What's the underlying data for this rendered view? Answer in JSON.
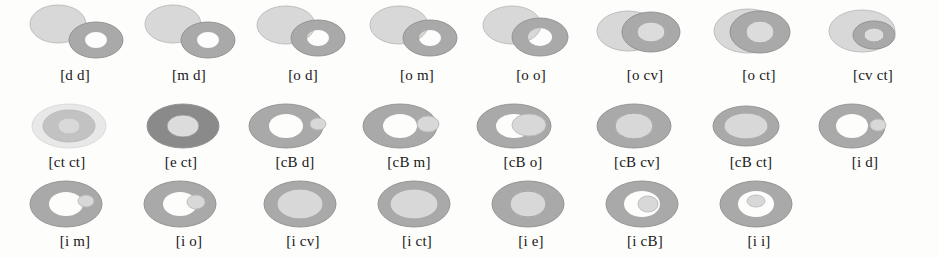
{
  "figure": {
    "background_color": "#fdfdfc",
    "label_color": "#181818",
    "palette": {
      "disc_light": "#d8d8d8",
      "disc_light_stroke": "#b9b9b9",
      "annulus_mid": "#a9a9a9",
      "annulus_mid_stroke": "#8e8e8e",
      "annulus_dark": "#8a8a8a",
      "hole_white": "#ffffff",
      "hole_light": "#dcdcdc",
      "outline": "#9a9a9a"
    },
    "rows": [
      {
        "row_index": 1,
        "cells": [
          {
            "label": "[d d]",
            "relation": "disjoint-disjoint",
            "disc": {
              "cx": 38,
              "cy": 24,
              "rx": 28,
              "ry": 19,
              "fill": "disc_light"
            },
            "annulus": {
              "cx": 76,
              "cy": 40,
              "rx": 27,
              "ry": 18,
              "hole_rx": 11,
              "hole_ry": 8,
              "fill": "annulus_mid",
              "hole_fill": "hole_white"
            }
          },
          {
            "label": "[m d]",
            "relation": "meet-disjoint",
            "disc": {
              "cx": 39,
              "cy": 24,
              "rx": 28,
              "ry": 19,
              "fill": "disc_light"
            },
            "annulus": {
              "cx": 74,
              "cy": 40,
              "rx": 27,
              "ry": 18,
              "hole_rx": 11,
              "hole_ry": 8,
              "fill": "annulus_mid",
              "hole_fill": "hole_white"
            }
          },
          {
            "label": "[o d]",
            "relation": "overlap-disjoint",
            "disc": {
              "cx": 38,
              "cy": 25,
              "rx": 29,
              "ry": 19,
              "fill": "disc_light"
            },
            "annulus": {
              "cx": 70,
              "cy": 38,
              "rx": 27,
              "ry": 18,
              "hole_rx": 11,
              "hole_ry": 8,
              "fill": "annulus_mid",
              "hole_fill": "hole_white"
            }
          },
          {
            "label": "[o m]",
            "relation": "overlap-meet",
            "disc": {
              "cx": 37,
              "cy": 25,
              "rx": 29,
              "ry": 19,
              "fill": "disc_light"
            },
            "annulus": {
              "cx": 68,
              "cy": 38,
              "rx": 27,
              "ry": 18,
              "hole_rx": 11,
              "hole_ry": 8,
              "fill": "annulus_mid",
              "hole_fill": "hole_white"
            }
          },
          {
            "label": "[o o]",
            "relation": "overlap-overlap",
            "disc": {
              "cx": 36,
              "cy": 25,
              "rx": 29,
              "ry": 19,
              "fill": "disc_light"
            },
            "annulus": {
              "cx": 64,
              "cy": 37,
              "rx": 28,
              "ry": 19,
              "hole_rx": 12,
              "hole_ry": 9,
              "fill": "annulus_mid",
              "hole_fill": "hole_white"
            }
          },
          {
            "label": "[o cv]",
            "relation": "overlap-covers",
            "disc": {
              "cx": 38,
              "cy": 31,
              "rx": 31,
              "ry": 20,
              "fill": "disc_light"
            },
            "annulus": {
              "cx": 61,
              "cy": 32,
              "rx": 29,
              "ry": 20,
              "hole_rx": 14,
              "hole_ry": 10,
              "fill": "annulus_mid",
              "hole_fill": "hole_light"
            }
          },
          {
            "label": "[o ct]",
            "relation": "overlap-contains",
            "disc": {
              "cx": 44,
              "cy": 31,
              "rx": 34,
              "ry": 22,
              "fill": "disc_light"
            },
            "annulus": {
              "cx": 56,
              "cy": 32,
              "rx": 30,
              "ry": 21,
              "hole_rx": 14,
              "hole_ry": 11,
              "fill": "annulus_mid",
              "hole_fill": "hole_light"
            }
          },
          {
            "label": "[cv ct]",
            "relation": "covers-contains",
            "disc": {
              "cx": 44,
              "cy": 31,
              "rx": 33,
              "ry": 21,
              "fill": "disc_light"
            },
            "annulus": {
              "cx": 56,
              "cy": 35,
              "rx": 21,
              "ry": 14,
              "hole_rx": 10,
              "hole_ry": 7,
              "fill": "annulus_mid",
              "hole_fill": "hole_light"
            }
          }
        ]
      },
      {
        "row_index": 2,
        "cells": [
          {
            "label": "[ct ct]",
            "relation": "contains-contains",
            "disc": {
              "cx": 57,
              "cy": 26,
              "rx": 37,
              "ry": 22,
              "fill": "disc_light"
            },
            "annulus": {
              "cx": 57,
              "cy": 26,
              "rx": 26,
              "ry": 16,
              "hole_rx": 11,
              "hole_ry": 8,
              "fill": "annulus_mid",
              "hole_fill": "hole_light"
            }
          },
          {
            "label": "[e ct]",
            "relation": "equal-contains",
            "disc": {
              "cx": 57,
              "cy": 26,
              "rx": 36,
              "ry": 22,
              "fill": "annulus_dark"
            },
            "annulus": {
              "cx": 57,
              "cy": 26,
              "rx": 36,
              "ry": 22,
              "hole_rx": 16,
              "hole_ry": 11,
              "fill": "annulus_dark",
              "hole_fill": "hole_light"
            }
          },
          {
            "label": "[cB d]",
            "relation": "coveredBy-disjoint",
            "disc": {
              "cx": 52,
              "cy": 26,
              "rx": 37,
              "ry": 22,
              "fill": "annulus_mid"
            },
            "annulus": {
              "cx": 46,
              "cy": 26,
              "rx": 37,
              "ry": 22,
              "hole_rx": 17,
              "hole_ry": 12,
              "fill": "annulus_mid",
              "hole_fill": "hole_white"
            },
            "small_disc": {
              "cx": 78,
              "cy": 24,
              "rx": 8,
              "ry": 6,
              "fill": "disc_light"
            }
          },
          {
            "label": "[cB m]",
            "relation": "coveredBy-meet",
            "disc": {
              "cx": 52,
              "cy": 26,
              "rx": 37,
              "ry": 22,
              "fill": "annulus_mid"
            },
            "annulus": {
              "cx": 46,
              "cy": 26,
              "rx": 37,
              "ry": 22,
              "hole_rx": 17,
              "hole_ry": 12,
              "fill": "annulus_mid",
              "hole_fill": "hole_white"
            },
            "small_disc": {
              "cx": 74,
              "cy": 24,
              "rx": 11,
              "ry": 8,
              "fill": "disc_light"
            }
          },
          {
            "label": "[cB o]",
            "relation": "coveredBy-overlap",
            "disc": {
              "cx": 52,
              "cy": 26,
              "rx": 37,
              "ry": 22,
              "fill": "annulus_mid"
            },
            "annulus": {
              "cx": 46,
              "cy": 26,
              "rx": 37,
              "ry": 22,
              "hole_rx": 18,
              "hole_ry": 12,
              "fill": "annulus_mid",
              "hole_fill": "hole_white"
            },
            "small_disc": {
              "cx": 61,
              "cy": 25,
              "rx": 17,
              "ry": 11,
              "fill": "disc_light"
            }
          },
          {
            "label": "[cB cv]",
            "relation": "coveredBy-covers",
            "disc": {
              "cx": 52,
              "cy": 26,
              "rx": 37,
              "ry": 22,
              "fill": "annulus_mid"
            },
            "annulus": {
              "cx": 52,
              "cy": 26,
              "rx": 37,
              "ry": 22,
              "hole_rx": 19,
              "hole_ry": 13,
              "fill": "annulus_mid",
              "hole_fill": "disc_light"
            }
          },
          {
            "label": "[cB ct]",
            "relation": "coveredBy-contains",
            "disc": {
              "cx": 50,
              "cy": 26,
              "rx": 33,
              "ry": 20,
              "fill": "annulus_mid"
            },
            "annulus": {
              "cx": 50,
              "cy": 26,
              "rx": 33,
              "ry": 20,
              "hole_rx": 22,
              "hole_ry": 13,
              "fill": "annulus_mid",
              "hole_fill": "disc_light"
            }
          },
          {
            "label": "[i d]",
            "relation": "inside-disjoint",
            "disc": {
              "cx": 48,
              "cy": 26,
              "rx": 33,
              "ry": 22,
              "fill": "annulus_mid"
            },
            "annulus": {
              "cx": 42,
              "cy": 26,
              "rx": 33,
              "ry": 22,
              "hole_rx": 16,
              "hole_ry": 12,
              "fill": "annulus_mid",
              "hole_fill": "hole_white"
            },
            "small_disc": {
              "cx": 68,
              "cy": 25,
              "rx": 8,
              "ry": 6,
              "fill": "disc_light"
            }
          }
        ]
      },
      {
        "row_index": 3,
        "cells": [
          {
            "label": "[i m]",
            "relation": "inside-meet",
            "disc": {
              "cx": 52,
              "cy": 25,
              "rx": 36,
              "ry": 23,
              "fill": "annulus_mid"
            },
            "annulus": {
              "cx": 46,
              "cy": 25,
              "rx": 36,
              "ry": 23,
              "hole_rx": 17,
              "hole_ry": 12,
              "fill": "annulus_mid",
              "hole_fill": "hole_white"
            },
            "small_disc": {
              "cx": 66,
              "cy": 22,
              "rx": 8,
              "ry": 6,
              "fill": "disc_light"
            }
          },
          {
            "label": "[i o]",
            "relation": "inside-overlap",
            "disc": {
              "cx": 52,
              "cy": 25,
              "rx": 36,
              "ry": 23,
              "fill": "annulus_mid"
            },
            "annulus": {
              "cx": 46,
              "cy": 25,
              "rx": 36,
              "ry": 23,
              "hole_rx": 17,
              "hole_ry": 12,
              "fill": "annulus_mid",
              "hole_fill": "hole_white"
            },
            "small_disc": {
              "cx": 62,
              "cy": 23,
              "rx": 9,
              "ry": 7,
              "fill": "disc_light"
            }
          },
          {
            "label": "[i cv]",
            "relation": "inside-covers",
            "disc": {
              "cx": 52,
              "cy": 25,
              "rx": 36,
              "ry": 23,
              "fill": "annulus_mid"
            },
            "annulus": {
              "cx": 52,
              "cy": 25,
              "rx": 36,
              "ry": 23,
              "hole_rx": 23,
              "hole_ry": 15,
              "fill": "annulus_mid",
              "hole_fill": "disc_light"
            }
          },
          {
            "label": "[i ct]",
            "relation": "inside-contains",
            "disc": {
              "cx": 52,
              "cy": 25,
              "rx": 36,
              "ry": 23,
              "fill": "annulus_mid"
            },
            "annulus": {
              "cx": 52,
              "cy": 25,
              "rx": 36,
              "ry": 23,
              "hole_rx": 24,
              "hole_ry": 15,
              "fill": "annulus_mid",
              "hole_fill": "disc_light"
            }
          },
          {
            "label": "[i e]",
            "relation": "inside-equal",
            "disc": {
              "cx": 52,
              "cy": 25,
              "rx": 36,
              "ry": 23,
              "fill": "annulus_mid"
            },
            "annulus": {
              "cx": 52,
              "cy": 25,
              "rx": 36,
              "ry": 23,
              "hole_rx": 18,
              "hole_ry": 13,
              "fill": "annulus_mid",
              "hole_fill": "disc_light"
            }
          },
          {
            "label": "[i cB]",
            "relation": "inside-coveredBy",
            "disc": {
              "cx": 52,
              "cy": 25,
              "rx": 36,
              "ry": 23,
              "fill": "annulus_mid"
            },
            "annulus": {
              "cx": 52,
              "cy": 25,
              "rx": 36,
              "ry": 23,
              "hole_rx": 18,
              "hole_ry": 13,
              "fill": "annulus_mid",
              "hole_fill": "hole_white"
            },
            "small_disc": {
              "cx": 58,
              "cy": 25,
              "rx": 10,
              "ry": 8,
              "fill": "disc_light"
            }
          },
          {
            "label": "[i i]",
            "relation": "inside-inside",
            "disc": {
              "cx": 52,
              "cy": 25,
              "rx": 36,
              "ry": 23,
              "fill": "annulus_mid"
            },
            "annulus": {
              "cx": 52,
              "cy": 25,
              "rx": 36,
              "ry": 23,
              "hole_rx": 18,
              "hole_ry": 13,
              "fill": "annulus_mid",
              "hole_fill": "hole_white"
            },
            "small_disc": {
              "cx": 52,
              "cy": 22,
              "rx": 9,
              "ry": 6,
              "fill": "disc_light"
            }
          }
        ]
      }
    ]
  }
}
